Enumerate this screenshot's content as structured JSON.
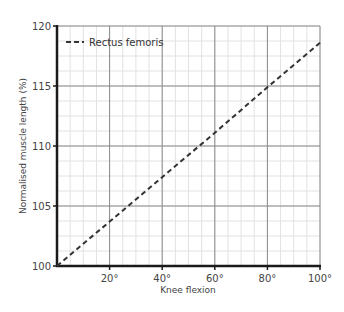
{
  "chart_data": {
    "type": "line",
    "title": "",
    "xlabel": "Knee flexion",
    "ylabel": "Normalised muscle length (%)",
    "xlim": [
      0,
      100
    ],
    "ylim": [
      100,
      120
    ],
    "x_ticks": [
      20,
      40,
      60,
      80,
      100
    ],
    "x_tick_labels": [
      "20°",
      "40°",
      "60°",
      "80°",
      "100°"
    ],
    "y_ticks": [
      100,
      105,
      110,
      115,
      120
    ],
    "y_tick_labels": [
      "100",
      "105",
      "110",
      "115",
      "120"
    ],
    "grid": {
      "major": true,
      "minor": true,
      "x_major_step": 20,
      "x_minor_step": 5,
      "y_major_step": 5,
      "y_minor_step": 1.25
    },
    "legend": {
      "position": "upper left",
      "entries": [
        "Rectus femoris"
      ]
    },
    "series": [
      {
        "name": "Rectus femoris",
        "style": "dashed",
        "color": "#333333",
        "x": [
          0,
          20,
          40,
          60,
          80,
          100
        ],
        "y": [
          100,
          103.7,
          107.4,
          111.1,
          114.9,
          118.6
        ]
      }
    ]
  },
  "colors": {
    "axis": "#1a1a1a",
    "major_grid": "#8a8a8a",
    "minor_grid": "#e2e2e2",
    "line": "#333333"
  }
}
